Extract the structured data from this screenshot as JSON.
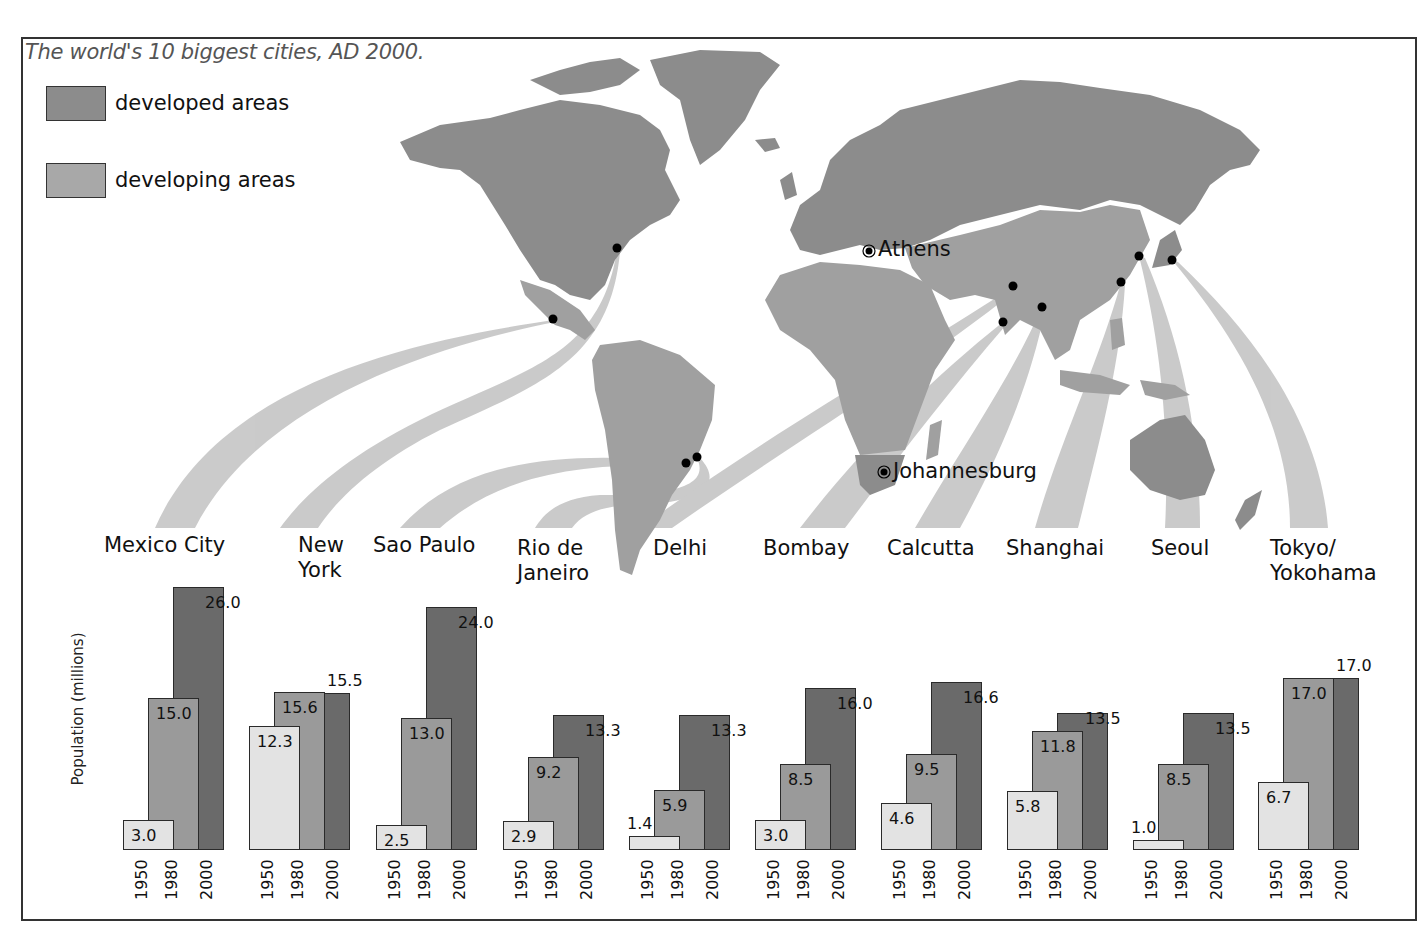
{
  "title": "The world's 10 biggest cities, AD 2000.",
  "legend": [
    {
      "label": "developed areas",
      "color": "#8c8c8c"
    },
    {
      "label": "developing areas",
      "color": "#a8a8a8"
    }
  ],
  "map_labels": {
    "athens": "Athens",
    "johannesburg": "Johannesburg"
  },
  "colors": {
    "developed": "#8c8c8c",
    "developing": "#a8a8a8",
    "ribbon": "#c8c8c8",
    "bar_1950": "#e3e3e3",
    "bar_1980": "#9a9a9a",
    "bar_2000": "#6a6a6a"
  },
  "chart_data": {
    "type": "bar",
    "title": "The world's 10 biggest cities, AD 2000.",
    "xlabel": "",
    "ylabel": "Population (millions)",
    "ylim": [
      0,
      26
    ],
    "grid": false,
    "legend_position": "top-left",
    "years": [
      "1950",
      "1980",
      "2000"
    ],
    "categories": [
      "Mexico City",
      "New York",
      "Sao Paulo",
      "Rio de Janeiro",
      "Delhi",
      "Bombay",
      "Calcutta",
      "Shanghai",
      "Seoul",
      "Tokyo/ Yokohama"
    ],
    "series": [
      {
        "name": "1950",
        "values": [
          3.0,
          12.3,
          2.5,
          2.9,
          1.4,
          3.0,
          4.6,
          5.8,
          1.0,
          6.7
        ]
      },
      {
        "name": "1980",
        "values": [
          15.0,
          15.6,
          13.0,
          9.2,
          5.9,
          8.5,
          9.5,
          11.8,
          8.5,
          17.0
        ]
      },
      {
        "name": "2000",
        "values": [
          26.0,
          15.5,
          24.0,
          13.3,
          13.3,
          16.0,
          16.6,
          13.5,
          13.5,
          17.0
        ]
      }
    ],
    "value_labels": [
      [
        "3.0",
        "15.0",
        "26.0"
      ],
      [
        "12.3",
        "15.6",
        "15.5"
      ],
      [
        "2.5",
        "13.0",
        "24.0"
      ],
      [
        "2.9",
        "9.2",
        "13.3"
      ],
      [
        "1.4",
        "5.9",
        "13.3"
      ],
      [
        "3.0",
        "8.5",
        "16.0"
      ],
      [
        "4.6",
        "9.5",
        "16.6"
      ],
      [
        "5.8",
        "11.8",
        "13.5"
      ],
      [
        "1.0",
        "8.5",
        "13.5"
      ],
      [
        "6.7",
        "17.0",
        "17.0"
      ]
    ],
    "annotations": [
      "Athens",
      "Johannesburg"
    ]
  },
  "cities": [
    {
      "line1": "Mexico City",
      "line2": ""
    },
    {
      "line1": "New",
      "line2": "York"
    },
    {
      "line1": "Sao Paulo",
      "line2": ""
    },
    {
      "line1": "Rio de",
      "line2": "Janeiro"
    },
    {
      "line1": "Delhi",
      "line2": ""
    },
    {
      "line1": "Bombay",
      "line2": ""
    },
    {
      "line1": "Calcutta",
      "line2": ""
    },
    {
      "line1": "Shanghai",
      "line2": ""
    },
    {
      "line1": "Seoul",
      "line2": ""
    },
    {
      "line1": "Tokyo/",
      "line2": "Yokohama"
    }
  ]
}
